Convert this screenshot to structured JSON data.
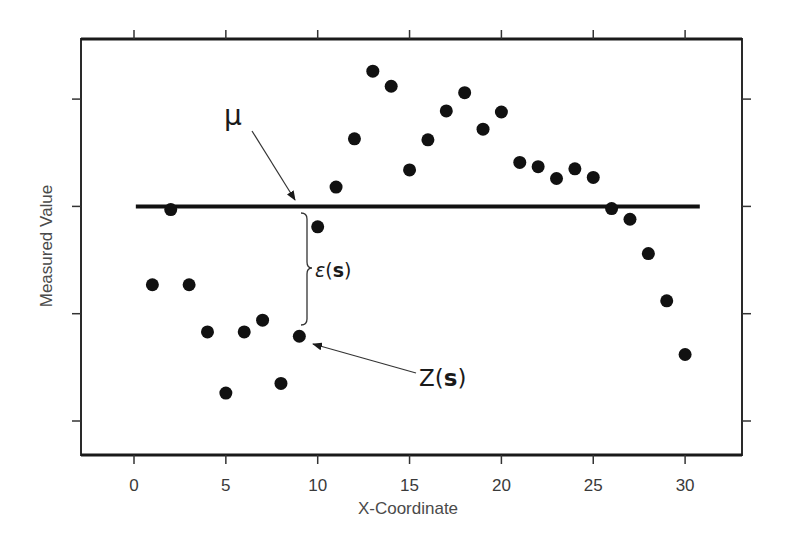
{
  "chart_data": {
    "type": "scatter",
    "title": "",
    "xlabel": "X-Coordinate",
    "ylabel": "Measured Value",
    "xlim": [
      -2.9,
      33.1
    ],
    "ylim": [
      -0.32,
      3.56
    ],
    "x_ticks": [
      0,
      5,
      10,
      15,
      20,
      25,
      30
    ],
    "x_tick_labels": [
      "0",
      "5",
      "10",
      "15",
      "20",
      "25",
      "30"
    ],
    "y_ticks": [
      0,
      1,
      2,
      3
    ],
    "y_tick_labels": [
      "",
      "",
      "",
      ""
    ],
    "grid": false,
    "legend": null,
    "series": [
      {
        "name": "Z(s) observations",
        "marker": "filled-circle",
        "color": "#111111",
        "x": [
          1,
          2,
          3,
          4,
          5,
          6,
          7,
          8,
          9,
          10,
          11,
          12,
          13,
          14,
          15,
          16,
          17,
          18,
          19,
          20,
          21,
          22,
          23,
          24,
          25,
          26,
          27,
          28,
          29,
          30
        ],
        "y": [
          1.27,
          1.97,
          1.27,
          0.83,
          0.26,
          0.83,
          0.94,
          0.35,
          0.79,
          1.81,
          2.18,
          2.63,
          3.26,
          3.12,
          2.34,
          2.62,
          2.89,
          3.06,
          2.72,
          2.88,
          2.41,
          2.37,
          2.26,
          2.35,
          2.27,
          1.98,
          1.88,
          1.56,
          1.12,
          0.62
        ]
      }
    ],
    "mean_line": {
      "label": "μ",
      "y": 2.0,
      "x_start": 0.1,
      "x_end": 30.8,
      "color": "#111111"
    },
    "annotations": [
      {
        "text": "μ",
        "role": "mean-label",
        "arrow_to": [
          8.9,
          2.06
        ]
      },
      {
        "text": "ε(s)",
        "role": "residual-brace-label",
        "brace_x": 9.3,
        "brace_from_y": 1.95,
        "brace_to_y": 0.9
      },
      {
        "text": "Z(s)",
        "role": "observation-label",
        "arrow_to": [
          9.6,
          0.72
        ]
      }
    ]
  },
  "labels": {
    "x_axis_title": "X-Coordinate",
    "y_axis_title": "Measured Value",
    "mu": "μ",
    "epsilon": "ε",
    "epsilon_paren_open": "(",
    "epsilon_s": "s",
    "epsilon_paren_close": ")",
    "z": "Z",
    "z_paren_open": "(",
    "z_s": "s",
    "z_paren_close": ")"
  }
}
